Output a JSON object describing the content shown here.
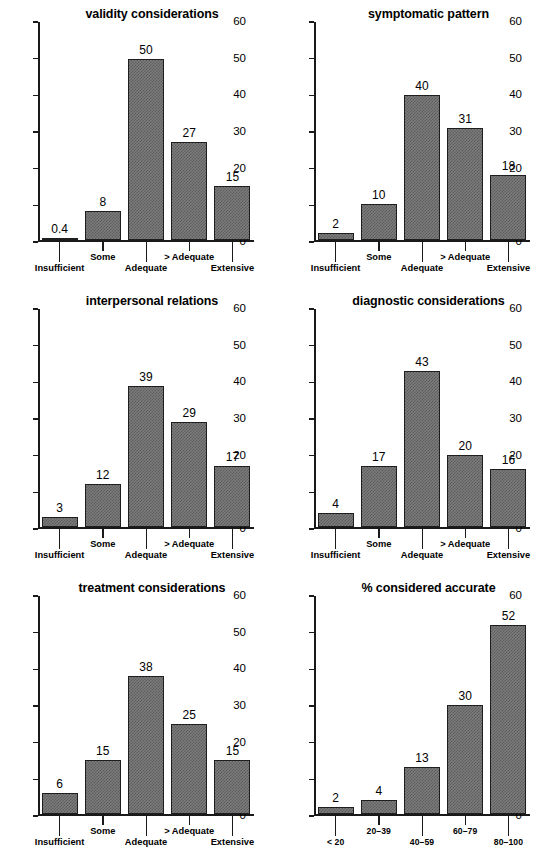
{
  "figure": {
    "panel_count": 6,
    "axis_color": "#1a1a1a",
    "bar_fill": "#7c7c7c",
    "bar_edge": "#1e1e1e",
    "background": "#ffffff",
    "clipped_header_fragment": ""
  },
  "yaxis": {
    "ticks": [
      "0",
      "10",
      "20",
      "30",
      "40",
      "50",
      "60"
    ],
    "min": 0,
    "max": 60
  },
  "categories_rating": [
    "Insufficient",
    "Some",
    "Adequate",
    "> Adequate",
    "Extensive"
  ],
  "categories_percent": [
    "< 20",
    "20–39",
    "40–59",
    "60–79",
    "80–100"
  ],
  "panels": [
    {
      "id": "validity-considerations",
      "title": "validity considerations",
      "categories": [
        "Insufficient",
        "Some",
        "Adequate",
        "> Adequate",
        "Extensive"
      ],
      "labels": [
        "0.4",
        "8",
        "50",
        "27",
        "15"
      ],
      "values": [
        0.4,
        8,
        50,
        27,
        15
      ]
    },
    {
      "id": "symptomatic-pattern",
      "title": "symptomatic pattern",
      "categories": [
        "Insufficient",
        "Some",
        "Adequate",
        "> Adequate",
        "Extensive"
      ],
      "labels": [
        "2",
        "10",
        "40",
        "31",
        "18"
      ],
      "values": [
        2,
        10,
        40,
        31,
        18
      ]
    },
    {
      "id": "interpersonal-relations",
      "title": "interpersonal relations",
      "categories": [
        "Insufficient",
        "Some",
        "Adequate",
        "> Adequate",
        "Extensive"
      ],
      "labels": [
        "3",
        "12",
        "39",
        "29",
        "17"
      ],
      "values": [
        3,
        12,
        39,
        29,
        17
      ]
    },
    {
      "id": "diagnostic-considerations",
      "title": "diagnostic considerations",
      "categories": [
        "Insufficient",
        "Some",
        "Adequate",
        "> Adequate",
        "Extensive"
      ],
      "labels": [
        "4",
        "17",
        "43",
        "20",
        "16"
      ],
      "values": [
        4,
        17,
        43,
        20,
        16
      ]
    },
    {
      "id": "treatment-considerations",
      "title": "treatment considerations",
      "categories": [
        "Insufficient",
        "Some",
        "Adequate",
        "> Adequate",
        "Extensive"
      ],
      "labels": [
        "6",
        "15",
        "38",
        "25",
        "15"
      ],
      "values": [
        6,
        15,
        38,
        25,
        15
      ]
    },
    {
      "id": "percent-considered-accurate",
      "title": "% considered accurate",
      "categories": [
        "< 20",
        "20–39",
        "40–59",
        "60–79",
        "80–100"
      ],
      "labels": [
        "2",
        "4",
        "13",
        "30",
        "52"
      ],
      "values": [
        2,
        4,
        13,
        30,
        52
      ]
    }
  ],
  "chart_data": [
    {
      "type": "bar",
      "title": "validity considerations",
      "categories": [
        "Insufficient",
        "Some",
        "Adequate",
        "> Adequate",
        "Extensive"
      ],
      "values": [
        0.4,
        8,
        50,
        27,
        15
      ],
      "data_labels": [
        "0.4",
        "8",
        "50",
        "27",
        "15"
      ],
      "xlabel": "",
      "ylabel": "",
      "ylim": [
        0,
        60
      ],
      "yticks": [
        0,
        10,
        20,
        30,
        40,
        50,
        60
      ],
      "grid": false,
      "legend": false
    },
    {
      "type": "bar",
      "title": "symptomatic pattern",
      "categories": [
        "Insufficient",
        "Some",
        "Adequate",
        "> Adequate",
        "Extensive"
      ],
      "values": [
        2,
        10,
        40,
        31,
        18
      ],
      "data_labels": [
        "2",
        "10",
        "40",
        "31",
        "18"
      ],
      "xlabel": "",
      "ylabel": "",
      "ylim": [
        0,
        60
      ],
      "yticks": [
        0,
        10,
        20,
        30,
        40,
        50,
        60
      ],
      "grid": false,
      "legend": false
    },
    {
      "type": "bar",
      "title": "interpersonal relations",
      "categories": [
        "Insufficient",
        "Some",
        "Adequate",
        "> Adequate",
        "Extensive"
      ],
      "values": [
        3,
        12,
        39,
        29,
        17
      ],
      "data_labels": [
        "3",
        "12",
        "39",
        "29",
        "17"
      ],
      "xlabel": "",
      "ylabel": "",
      "ylim": [
        0,
        60
      ],
      "yticks": [
        0,
        10,
        20,
        30,
        40,
        50,
        60
      ],
      "grid": false,
      "legend": false
    },
    {
      "type": "bar",
      "title": "diagnostic considerations",
      "categories": [
        "Insufficient",
        "Some",
        "Adequate",
        "> Adequate",
        "Extensive"
      ],
      "values": [
        4,
        17,
        43,
        20,
        16
      ],
      "data_labels": [
        "4",
        "17",
        "43",
        "20",
        "16"
      ],
      "xlabel": "",
      "ylabel": "",
      "ylim": [
        0,
        60
      ],
      "yticks": [
        0,
        10,
        20,
        30,
        40,
        50,
        60
      ],
      "grid": false,
      "legend": false
    },
    {
      "type": "bar",
      "title": "treatment considerations",
      "categories": [
        "Insufficient",
        "Some",
        "Adequate",
        "> Adequate",
        "Extensive"
      ],
      "values": [
        6,
        15,
        38,
        25,
        15
      ],
      "data_labels": [
        "6",
        "15",
        "38",
        "25",
        "15"
      ],
      "xlabel": "",
      "ylabel": "",
      "ylim": [
        0,
        60
      ],
      "yticks": [
        0,
        10,
        20,
        30,
        40,
        50,
        60
      ],
      "grid": false,
      "legend": false
    },
    {
      "type": "bar",
      "title": "% considered accurate",
      "categories": [
        "< 20",
        "20–39",
        "40–59",
        "60–79",
        "80–100"
      ],
      "values": [
        2,
        4,
        13,
        30,
        52
      ],
      "data_labels": [
        "2",
        "4",
        "13",
        "30",
        "52"
      ],
      "xlabel": "",
      "ylabel": "",
      "ylim": [
        0,
        60
      ],
      "yticks": [
        0,
        10,
        20,
        30,
        40,
        50,
        60
      ],
      "grid": false,
      "legend": false
    }
  ]
}
